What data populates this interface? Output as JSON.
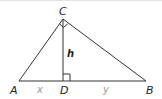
{
  "diagram": {
    "type": "right-triangle-with-altitude",
    "vertices": {
      "A": {
        "label": "A",
        "x": 19,
        "y": 81
      },
      "B": {
        "label": "B",
        "x": 146,
        "y": 81
      },
      "C": {
        "label": "C",
        "x": 63,
        "y": 19
      },
      "D": {
        "label": "D",
        "x": 63,
        "y": 81
      }
    },
    "segments": {
      "AD": {
        "label": "x"
      },
      "DB": {
        "label": "y"
      },
      "CD": {
        "label": "h"
      }
    },
    "right_angles": [
      "C",
      "D"
    ],
    "colors": {
      "stroke": "#333333",
      "vertex_label": "#222222",
      "segment_label": "#9a9a9a"
    }
  }
}
